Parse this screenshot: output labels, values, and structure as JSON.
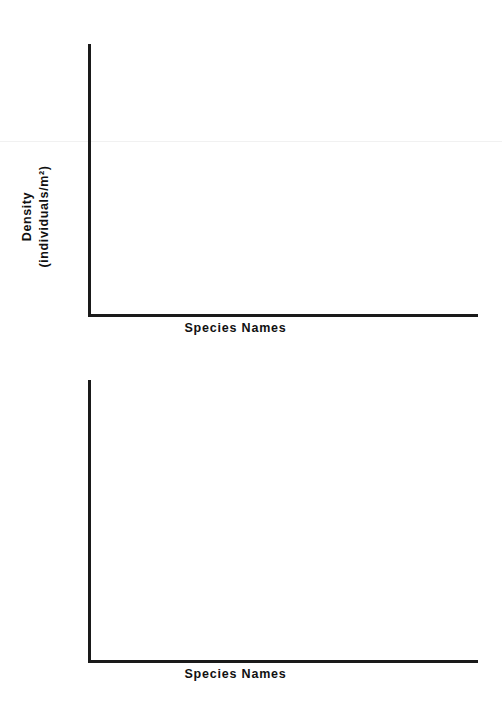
{
  "page": {
    "background_color": "#ffffff",
    "ink_color": "#1a1a1a"
  },
  "figures": [
    {
      "id": "density",
      "ylabel_line1": "Density",
      "ylabel_line2": "(individuals/m²)",
      "xlabel": "Species Names"
    },
    {
      "id": "cover",
      "ylabel_line1": "Percent Cover",
      "ylabel_line2": "(%)",
      "xlabel": "Species Names"
    }
  ],
  "chart_data": [
    {
      "type": "bar",
      "title": "",
      "subtitle": "",
      "xlabel": "Species Names",
      "ylabel": "Density (individuals/m²)",
      "categories": [],
      "values": [],
      "series": [],
      "xticklabels": [],
      "yticklabels": [],
      "ylim": [],
      "xlim": [],
      "grid": false,
      "legend": false,
      "legend_position": "none",
      "annotations": [],
      "note": "Blank template axes — no data plotted; axes drawn as an L (left spine and bottom spine only)."
    },
    {
      "type": "bar",
      "title": "",
      "subtitle": "",
      "xlabel": "Species Names",
      "ylabel": "Percent Cover (%)",
      "categories": [],
      "values": [],
      "series": [],
      "xticklabels": [],
      "yticklabels": [],
      "ylim": [],
      "xlim": [],
      "grid": false,
      "legend": false,
      "legend_position": "none",
      "annotations": [],
      "note": "Blank template axes — no data plotted; axes drawn as an L (left spine and bottom spine only)."
    }
  ]
}
